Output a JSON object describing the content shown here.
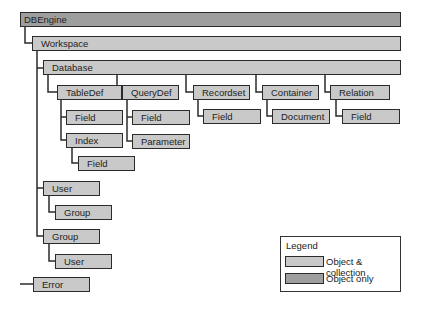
{
  "nodes": {
    "dbengine": "DBEngine",
    "workspace": "Workspace",
    "database": "Database",
    "tabledef": "TableDef",
    "tabledef_field": "Field",
    "index": "Index",
    "index_field": "Field",
    "querydef": "QueryDef",
    "querydef_field": "Field",
    "parameter": "Parameter",
    "recordset": "Recordset",
    "recordset_field": "Field",
    "container": "Container",
    "document": "Document",
    "relation": "Relation",
    "relation_field": "Field",
    "user": "User",
    "user_group": "Group",
    "group": "Group",
    "group_user": "User",
    "error": "Error"
  },
  "hierarchy": {
    "DBEngine": {
      "Workspace": {
        "Database": {
          "TableDef": [
            "Field",
            {
              "Index": [
                "Field"
              ]
            }
          ],
          "QueryDef": [
            "Field",
            "Parameter"
          ],
          "Recordset": [
            "Field"
          ],
          "Container": [
            "Document"
          ],
          "Relation": [
            "Field"
          ]
        },
        "User": [
          "Group"
        ],
        "Group": [
          "User"
        ]
      },
      "Error": []
    }
  },
  "node_types": {
    "object_only": [
      "DBEngine"
    ],
    "object_and_collection": [
      "Workspace",
      "Database",
      "TableDef",
      "Field",
      "Index",
      "QueryDef",
      "Parameter",
      "Recordset",
      "Container",
      "Document",
      "Relation",
      "User",
      "Group",
      "Error"
    ]
  },
  "legend": {
    "title": "Legend",
    "items": [
      {
        "label": "Object & collection",
        "color": "#c9c9c9"
      },
      {
        "label": "Object only",
        "color": "#9e9e9e"
      }
    ]
  },
  "colors": {
    "object_collection": "#c9c9c9",
    "object_only": "#9e9e9e",
    "border": "#2b2b2b"
  }
}
